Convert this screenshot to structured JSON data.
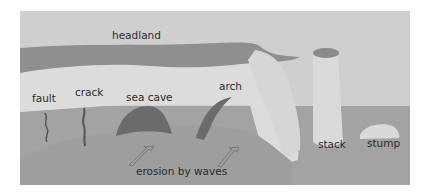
{
  "diagram": {
    "labels": {
      "headland": "headland",
      "fault": "fault",
      "crack": "crack",
      "sea_cave": "sea cave",
      "arch": "arch",
      "stack": "stack",
      "stump": "stump",
      "erosion": "erosion by waves"
    },
    "colors": {
      "sky": "#cfcfcf",
      "headland_top": "#8f8f8f",
      "cliff_face": "#dcdcdc",
      "sea": "#a3a3a3",
      "land_base": "#9e9e9e",
      "cave_dark": "#6b6b6b",
      "text": "#2b2b2b"
    }
  }
}
